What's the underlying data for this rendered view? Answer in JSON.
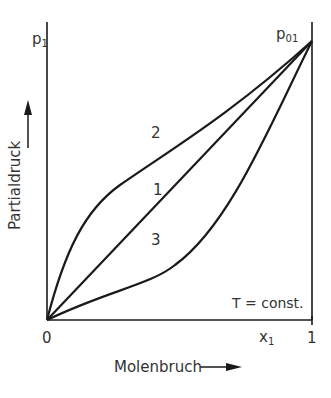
{
  "diagram": {
    "y_axis": {
      "symbol": "p",
      "symbol_sub": "1",
      "label": "Partialdruck"
    },
    "x_axis": {
      "symbol": "x",
      "symbol_sub": "1",
      "label": "Molenbruch",
      "tick_start": "0",
      "tick_end": "1"
    },
    "endpoint": {
      "symbol": "p",
      "symbol_sub": "01"
    },
    "condition": "T = const.",
    "curves": [
      {
        "id": "1",
        "label": "1",
        "description": "ideal (linear)"
      },
      {
        "id": "2",
        "label": "2",
        "description": "positive deviation"
      },
      {
        "id": "3",
        "label": "3",
        "description": "negative deviation"
      }
    ],
    "line_color": "#1a1a1a"
  }
}
